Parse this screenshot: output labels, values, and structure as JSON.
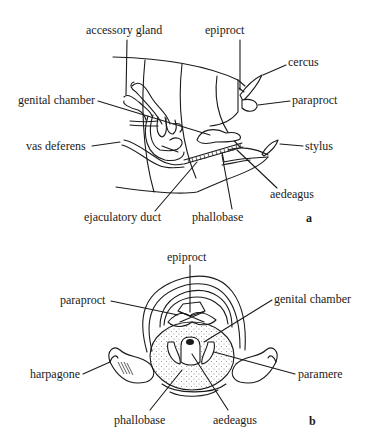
{
  "figure_a": {
    "panel_label": "a",
    "labels": {
      "accessory_gland": "accessory gland",
      "epiproct": "epiproct",
      "cercus": "cercus",
      "genital_chamber": "genital chamber",
      "paraproct": "paraproct",
      "vas_deferens": "vas deferens",
      "stylus": "stylus",
      "aedeagus": "aedeagus",
      "ejaculatory_duct": "ejaculatory duct",
      "phallobase": "phallobase"
    }
  },
  "figure_b": {
    "panel_label": "b",
    "labels": {
      "epiproct": "epiproct",
      "paraproct": "paraproct",
      "genital_chamber": "genital chamber",
      "harpagone": "harpagone",
      "paramere": "paramere",
      "phallobase": "phallobase",
      "aedeagus": "aedeagus"
    }
  }
}
